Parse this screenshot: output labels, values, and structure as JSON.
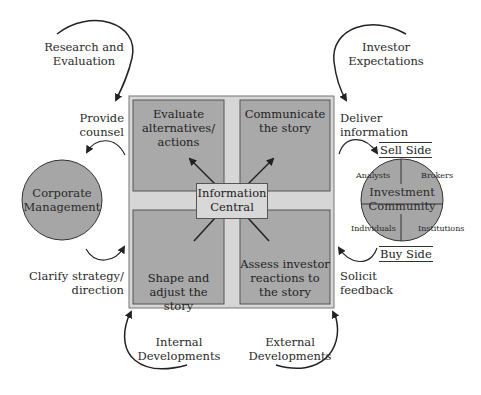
{
  "diagram": {
    "center": {
      "title": "Information Central",
      "line1": "Information",
      "line2": "Central"
    },
    "quadrants": [
      {
        "id": "top-left",
        "line1": "Evaluate",
        "line2": "alternatives/",
        "line3": "actions"
      },
      {
        "id": "top-right",
        "line1": "Communicate",
        "line2": "the story"
      },
      {
        "id": "bottom-left",
        "line1": "Shape and",
        "line2": "adjust the story"
      },
      {
        "id": "bottom-right",
        "line1": "Assess investor",
        "line2": "reactions to",
        "line3": "the story"
      }
    ],
    "corporate_management": {
      "line1": "Corporate",
      "line2": "Management"
    },
    "investment_community": {
      "line1": "Investment",
      "line2": "Community",
      "segments": {
        "top_left": "Analysts",
        "top_right": "Brokers",
        "bottom_left": "Individuals",
        "bottom_right": "Institutions"
      },
      "sell_side": "Sell Side",
      "buy_side": "Buy Side"
    },
    "flows": {
      "research": {
        "line1": "Research and",
        "line2": "Evaluation"
      },
      "investor_expectations": {
        "line1": "Investor",
        "line2": "Expectations"
      },
      "provide_counsel": {
        "line1": "Provide",
        "line2": "counsel"
      },
      "deliver_information": {
        "line1": "Deliver",
        "line2": "information"
      },
      "clarify_strategy": {
        "line1": "Clarify strategy/",
        "line2": "direction"
      },
      "solicit_feedback": {
        "line1": "Solicit",
        "line2": "feedback"
      },
      "internal_developments": {
        "line1": "Internal",
        "line2": "Developments"
      },
      "external_developments": {
        "line1": "External",
        "line2": "Developments"
      }
    },
    "colors": {
      "outer_frame": "#d6d6d6",
      "quadrant_fill": "#a9a9a9",
      "circle_fill": "#a6a6a6",
      "center_box": "#d8d8d8",
      "stroke": "#333333"
    }
  }
}
